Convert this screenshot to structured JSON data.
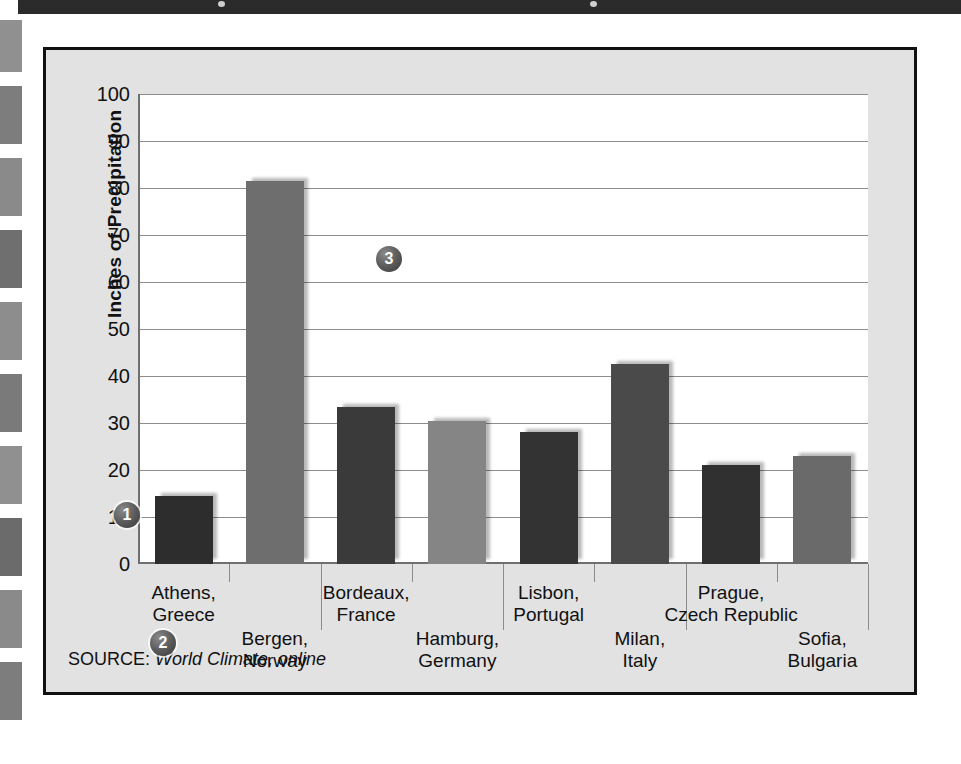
{
  "figure": {
    "source_label": "SOURCE:",
    "source_value": "World Climate, online"
  },
  "badges": [
    {
      "id": "badge-1",
      "label": "1",
      "x": 68,
      "y": 452
    },
    {
      "id": "badge-2",
      "label": "2",
      "x": 104,
      "y": 580
    },
    {
      "id": "badge-3",
      "label": "3",
      "x": 330,
      "y": 196
    }
  ],
  "edge_bands": [
    {
      "top": 20,
      "height": 52,
      "color": "#909090"
    },
    {
      "top": 86,
      "height": 58,
      "color": "#7d7d7d"
    },
    {
      "top": 158,
      "height": 58,
      "color": "#8a8a8a"
    },
    {
      "top": 230,
      "height": 58,
      "color": "#6f6f6f"
    },
    {
      "top": 302,
      "height": 58,
      "color": "#8d8d8d"
    },
    {
      "top": 374,
      "height": 58,
      "color": "#7a7a7a"
    },
    {
      "top": 446,
      "height": 58,
      "color": "#909090"
    },
    {
      "top": 518,
      "height": 58,
      "color": "#6b6b6b"
    },
    {
      "top": 590,
      "height": 58,
      "color": "#8a8a8a"
    },
    {
      "top": 662,
      "height": 58,
      "color": "#7d7d7d"
    }
  ],
  "chart_data": {
    "type": "bar",
    "title": "",
    "xlabel": "",
    "ylabel": "Inches of Precipitation",
    "ylim": [
      0,
      100
    ],
    "yticks": [
      100,
      90,
      80,
      70,
      60,
      50,
      40,
      30,
      20,
      10,
      0
    ],
    "grid": true,
    "legend": "none",
    "categories": [
      "Athens,\nGreece",
      "Bergen,\nNorway",
      "Bordeaux,\nFrance",
      "Hamburg,\nGermany",
      "Lisbon,\nPortugal",
      "Milan,\nItaly",
      "Prague,\nCzech Republic",
      "Sofia,\nBulgaria"
    ],
    "bars": [
      {
        "city": "Athens",
        "country": "Greece",
        "line1": "Athens,",
        "line2": "Greece",
        "value": 14.5,
        "color": "#2d2d2d",
        "stagger": "high"
      },
      {
        "city": "Bergen",
        "country": "Norway",
        "line1": "Bergen,",
        "line2": "Norway",
        "value": 81.5,
        "color": "#6e6e6e",
        "stagger": "low"
      },
      {
        "city": "Bordeaux",
        "country": "France",
        "line1": "Bordeaux,",
        "line2": "France",
        "value": 33.5,
        "color": "#3a3a3a",
        "stagger": "high"
      },
      {
        "city": "Hamburg",
        "country": "Germany",
        "line1": "Hamburg,",
        "line2": "Germany",
        "value": 30.5,
        "color": "#858585",
        "stagger": "low"
      },
      {
        "city": "Lisbon",
        "country": "Portugal",
        "line1": "Lisbon,",
        "line2": "Portugal",
        "value": 28.0,
        "color": "#333333",
        "stagger": "high"
      },
      {
        "city": "Milan",
        "country": "Italy",
        "line1": "Milan,",
        "line2": "Italy",
        "value": 42.5,
        "color": "#4a4a4a",
        "stagger": "low"
      },
      {
        "city": "Prague",
        "country": "Czech Republic",
        "line1": "Prague,",
        "line2": "Czech Republic",
        "value": 21.0,
        "color": "#303030",
        "stagger": "high"
      },
      {
        "city": "Sofia",
        "country": "Bulgaria",
        "line1": "Sofia,",
        "line2": "Bulgaria",
        "value": 23.0,
        "color": "#6a6a6a",
        "stagger": "low"
      }
    ]
  }
}
